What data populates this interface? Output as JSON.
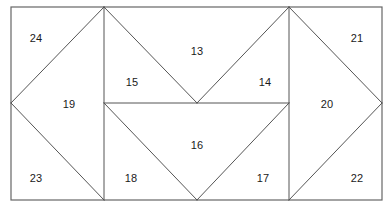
{
  "figure": {
    "kind": "geometric-dissection-diagram",
    "canvas": {
      "width": 391,
      "height": 208
    },
    "stroke_color": "#555555",
    "outline_color": "#666666",
    "background_color": "#ffffff",
    "stroke_width": 1,
    "outline_width": 1.2
  },
  "outline": {
    "name": "bounding-rectangle",
    "x": 11,
    "y": 7,
    "width": 371,
    "height": 193
  },
  "geometry": {
    "x_stops": [
      11,
      104,
      197,
      289,
      382
    ],
    "y_stops": [
      7,
      103,
      200
    ],
    "segments": [
      {
        "name": "left-diamond-upper-left",
        "x1": 104,
        "y1": 7,
        "x2": 11,
        "y2": 103
      },
      {
        "name": "left-diamond-lower-left",
        "x1": 11,
        "y1": 103,
        "x2": 104,
        "y2": 200
      },
      {
        "name": "top-v-left-arm",
        "x1": 104,
        "y1": 7,
        "x2": 197,
        "y2": 103
      },
      {
        "name": "top-v-right-arm",
        "x1": 197,
        "y1": 103,
        "x2": 289,
        "y2": 7
      },
      {
        "name": "bottom-v-left-arm",
        "x1": 104,
        "y1": 103,
        "x2": 197,
        "y2": 200
      },
      {
        "name": "bottom-v-right-arm",
        "x1": 197,
        "y1": 200,
        "x2": 289,
        "y2": 103
      },
      {
        "name": "right-diamond-upper-right",
        "x1": 289,
        "y1": 7,
        "x2": 382,
        "y2": 103
      },
      {
        "name": "right-diamond-lower-right",
        "x1": 382,
        "y1": 103,
        "x2": 289,
        "y2": 200
      },
      {
        "name": "vertical-left-divider",
        "x1": 104,
        "y1": 7,
        "x2": 104,
        "y2": 200
      },
      {
        "name": "vertical-right-divider",
        "x1": 289,
        "y1": 7,
        "x2": 289,
        "y2": 200
      },
      {
        "name": "horizontal-mid-divider",
        "x1": 104,
        "y1": 103,
        "x2": 289,
        "y2": 103
      }
    ]
  },
  "labels": [
    {
      "id": "label-24",
      "text": "24",
      "x": 36,
      "y": 38
    },
    {
      "id": "label-21",
      "text": "21",
      "x": 357,
      "y": 38
    },
    {
      "id": "label-13",
      "text": "13",
      "x": 197,
      "y": 51
    },
    {
      "id": "label-15",
      "text": "15",
      "x": 132,
      "y": 82
    },
    {
      "id": "label-14",
      "text": "14",
      "x": 265,
      "y": 82
    },
    {
      "id": "label-19",
      "text": "19",
      "x": 69,
      "y": 104
    },
    {
      "id": "label-20",
      "text": "20",
      "x": 327,
      "y": 104
    },
    {
      "id": "label-16",
      "text": "16",
      "x": 197,
      "y": 145
    },
    {
      "id": "label-23",
      "text": "23",
      "x": 36,
      "y": 178
    },
    {
      "id": "label-18",
      "text": "18",
      "x": 131,
      "y": 178
    },
    {
      "id": "label-17",
      "text": "17",
      "x": 263,
      "y": 178
    },
    {
      "id": "label-22",
      "text": "22",
      "x": 357,
      "y": 178
    }
  ]
}
